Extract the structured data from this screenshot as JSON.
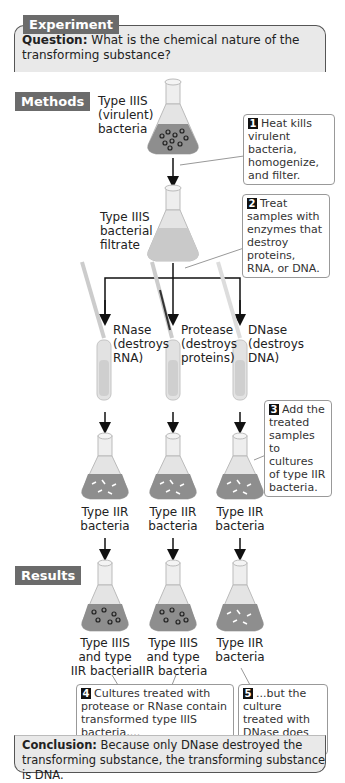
{
  "header": {
    "tag": "Experiment",
    "question_label": "Question:",
    "question_text": " What is the chemical nature of the transforming substance?"
  },
  "sections": {
    "methods": "Methods",
    "results": "Results"
  },
  "flasks": {
    "virulent": [
      "Type IIIS",
      "(virulent)",
      "bacteria"
    ],
    "filtrate": [
      "Type IIIS",
      "bacterial",
      "filtrate"
    ]
  },
  "enzymes": [
    {
      "name": "RNase",
      "line2": "(destroys",
      "line3": "RNA)"
    },
    {
      "name": "Protease",
      "line2": "(destroys",
      "line3": "proteins)"
    },
    {
      "name": "DNase",
      "line2": "(destroys",
      "line3": "DNA)"
    }
  ],
  "culture_labels": [
    [
      "Type IIR",
      "bacteria"
    ],
    [
      "Type IIR",
      "bacteria"
    ],
    [
      "Type IIR",
      "bacteria"
    ]
  ],
  "result_labels": [
    [
      "Type IIIS",
      "and type",
      "IIR bacteria"
    ],
    [
      "Type IIIS",
      "and type",
      "IIR bacteria"
    ],
    [
      "Type IIR",
      "bacteria"
    ]
  ],
  "steps": [
    {
      "num": "1",
      "text": "Heat kills virulent bacteria, homogenize, and filter."
    },
    {
      "num": "2",
      "text": "Treat samples with enzymes that destroy proteins, RNA, or DNA."
    },
    {
      "num": "3",
      "text": "Add the treated samples to cultures of type IIR bacteria."
    },
    {
      "num": "4",
      "text": "Cultures treated with protease or RNase contain transformed type IIIS bacteria,..."
    },
    {
      "num": "5",
      "text": "...but the culture treated with DNase does not."
    }
  ],
  "conclusion": {
    "label": "Conclusion:",
    "text": " Because only DNase destroyed the transforming substance, the transforming substance is DNA."
  },
  "colors": {
    "tag_bg": "#6b6b6b",
    "box_bg": "#e9e9e9",
    "liquid": "#8e8e8e",
    "glass": "#dcdcdc"
  }
}
